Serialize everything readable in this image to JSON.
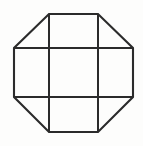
{
  "figure": {
    "title": "Octagon with internal tic-tac-toe grid",
    "type": "line-drawing",
    "canvas": {
      "width": 143,
      "height": 146,
      "background_color": "#fdfdfc"
    },
    "stroke": {
      "color": "#2b2b2b",
      "width_px": 2,
      "style": "solid"
    },
    "outline": {
      "name": "octagon",
      "sides": 8,
      "description": "Regular-ish octagon formed by a square with all four corners chamfered at 45 degrees",
      "vertices": [
        {
          "label": "top-left",
          "x": 49,
          "y": 14
        },
        {
          "label": "top-right",
          "x": 98,
          "y": 14
        },
        {
          "label": "right-top",
          "x": 133,
          "y": 48
        },
        {
          "label": "right-bottom",
          "x": 133,
          "y": 97
        },
        {
          "label": "bottom-right",
          "x": 98,
          "y": 132
        },
        {
          "label": "bottom-left",
          "x": 49,
          "y": 132
        },
        {
          "label": "left-bottom",
          "x": 14,
          "y": 97
        },
        {
          "label": "left-top",
          "x": 14,
          "y": 48
        }
      ],
      "path": "M 49 14 L 98 14 L 133 48 L 133 97 L 98 132 L 49 132 L 14 97 L 14 48 Z"
    },
    "interior_lines": [
      {
        "name": "vertical-left",
        "orientation": "vertical",
        "x": 49,
        "y1": 14,
        "y2": 132
      },
      {
        "name": "vertical-right",
        "orientation": "vertical",
        "x": 98,
        "y1": 14,
        "y2": 132
      },
      {
        "name": "horizontal-top",
        "orientation": "horizontal",
        "y": 48,
        "x1": 14,
        "x2": 133
      },
      {
        "name": "horizontal-bottom",
        "orientation": "horizontal",
        "y": 97,
        "x1": 14,
        "x2": 133
      }
    ],
    "inner_square": {
      "name": "central-cell",
      "x": 49,
      "y": 48,
      "width": 49,
      "height": 49
    },
    "grid": {
      "rows": 3,
      "columns": 3,
      "cells_total": 9,
      "corner_cells_chamfered": 4
    },
    "labels": {
      "none": ""
    }
  }
}
